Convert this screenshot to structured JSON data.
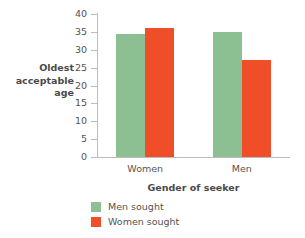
{
  "chart_data": {
    "type": "bar",
    "title": "",
    "xlabel": "Gender of seeker",
    "ylabel": "Oldest acceptable age",
    "ylabel_lines": [
      "Oldest",
      "acceptable",
      "age"
    ],
    "categories": [
      "Women",
      "Men"
    ],
    "series": [
      {
        "name": "Men sought",
        "color": "#8CBF92",
        "values": [
          34.5,
          35.0
        ]
      },
      {
        "name": "Women sought",
        "color": "#F04E28",
        "values": [
          36.0,
          27.0
        ]
      }
    ],
    "ylim": [
      0,
      40
    ],
    "yticks": [
      0,
      5,
      10,
      15,
      20,
      25,
      30,
      35,
      40
    ],
    "ytick_labels": [
      "0",
      "5",
      "10",
      "15",
      "20",
      "25",
      "30",
      "35",
      "40"
    ],
    "grid": false,
    "legend_position": "below-left"
  },
  "colors": {
    "green": "#8CBF92",
    "orange": "#F04E28",
    "axis": "#bdbdbd",
    "text": "#55534f",
    "background": "#ffffff"
  }
}
